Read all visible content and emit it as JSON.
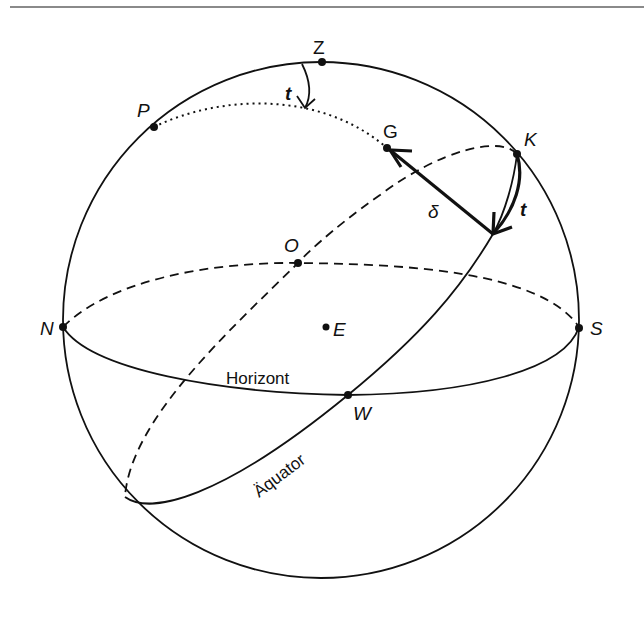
{
  "diagram": {
    "title": "",
    "points": {
      "Z": "Z",
      "P": "P",
      "G": "G",
      "K": "K",
      "O": "O",
      "N": "N",
      "S": "S",
      "E": "E",
      "W": "W"
    },
    "angle_labels": {
      "t_top": "t",
      "t_right": "t",
      "delta": "δ"
    },
    "curve_labels": {
      "horizon": "Horizont",
      "equator": "Äquator"
    },
    "colors": {
      "stroke": "#111111",
      "rule": "#8a8a8a",
      "background": "#ffffff"
    }
  }
}
